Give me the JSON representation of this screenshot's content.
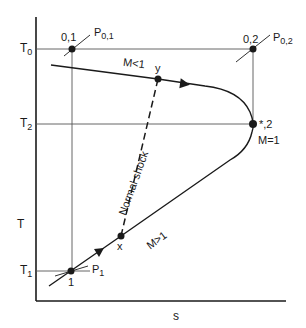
{
  "diagram": {
    "axes": {
      "x_label": "s",
      "y_label": "T"
    },
    "temperature_levels": [
      {
        "id": "T0",
        "main": "T",
        "sub": "0"
      },
      {
        "id": "T2",
        "main": "T",
        "sub": "2"
      },
      {
        "id": "T1",
        "main": "T",
        "sub": "1"
      }
    ],
    "states": {
      "p01": {
        "label": "0,1",
        "pressure_main": "P",
        "pressure_sub": "0,1"
      },
      "p02": {
        "label": "0,2",
        "pressure_main": "P",
        "pressure_sub": "0,2"
      },
      "star2": {
        "label": "*,2",
        "mach": "M=1"
      },
      "p1": {
        "label": "1",
        "pressure_main": "P",
        "pressure_sub": "1"
      },
      "x": {
        "label": "x"
      },
      "y": {
        "label": "y"
      }
    },
    "regions": {
      "subsonic": "M<1",
      "supersonic": "M>1",
      "shock": "Normal shock"
    },
    "colors": {
      "line": "#1a1a1a",
      "thin_line": "#555555",
      "background": "#ffffff"
    }
  }
}
